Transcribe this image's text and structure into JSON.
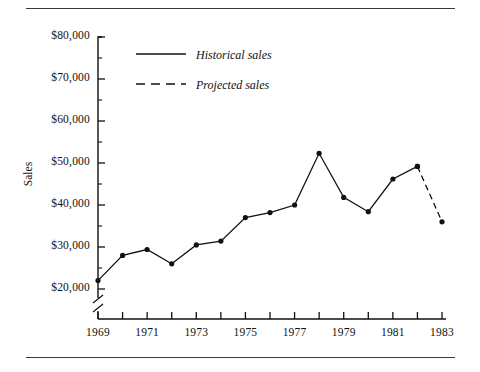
{
  "chart_data": {
    "type": "line",
    "title": "",
    "xlabel": "",
    "ylabel": "Sales",
    "x": [
      1969,
      1970,
      1971,
      1972,
      1973,
      1974,
      1975,
      1976,
      1977,
      1978,
      1979,
      1980,
      1981,
      1982,
      1983
    ],
    "series": [
      {
        "name": "Historical sales",
        "style": "solid",
        "x": [
          1969,
          1970,
          1971,
          1972,
          1973,
          1974,
          1975,
          1976,
          1977,
          1978,
          1979,
          1980,
          1981,
          1982
        ],
        "values": [
          22000,
          28000,
          29400,
          26000,
          30500,
          31400,
          37000,
          38200,
          40000,
          52300,
          41800,
          38400,
          46200,
          49200
        ]
      },
      {
        "name": "Projected sales",
        "style": "dashed",
        "x": [
          1982,
          1983
        ],
        "values": [
          49200,
          36000
        ]
      }
    ],
    "xlim": [
      1969,
      1983
    ],
    "ylim": [
      20000,
      80000
    ],
    "y_axis_break": true,
    "grid": false,
    "legend_position": "top-center",
    "y_ticks": [
      20000,
      30000,
      40000,
      50000,
      60000,
      70000,
      80000
    ],
    "y_minor_ticks": [
      25000,
      35000,
      45000,
      55000,
      65000,
      75000
    ],
    "y_tick_labels": [
      "$20,000",
      "$30,000",
      "$40,000",
      "$50,000",
      "$60,000",
      "$70,000",
      "$80,000"
    ],
    "x_ticks": [
      1969,
      1970,
      1971,
      1972,
      1973,
      1974,
      1975,
      1976,
      1977,
      1978,
      1979,
      1980,
      1981,
      1982,
      1983
    ],
    "x_tick_labels": [
      "1969",
      "1971",
      "1973",
      "1975",
      "1977",
      "1979",
      "1981",
      "1983"
    ],
    "x_labeled_years": [
      1969,
      1971,
      1973,
      1975,
      1977,
      1979,
      1981,
      1983
    ],
    "marker": "filled-circle",
    "line_color": "#111111"
  },
  "axis": {
    "y_title": "Sales",
    "y_labels": [
      "$80,000",
      "$70,000",
      "$60,000",
      "$50,000",
      "$40,000",
      "$30,000",
      "$20,000"
    ],
    "x_labels": [
      "1969",
      "1971",
      "1973",
      "1975",
      "1977",
      "1979",
      "1981",
      "1983"
    ]
  },
  "legend": {
    "historical_label": "Historical sales",
    "projected_label": "Projected sales"
  }
}
